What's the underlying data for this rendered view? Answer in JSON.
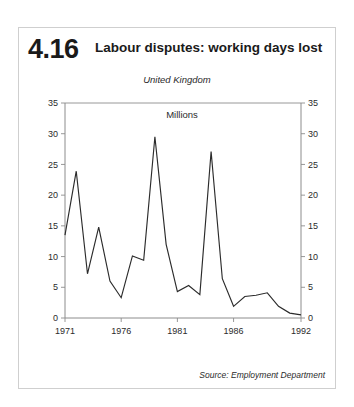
{
  "figure": {
    "number": "4.16",
    "title": "Labour disputes: working days lost",
    "region": "United Kingdom",
    "units": "Millions",
    "source": "Source: Employment Department",
    "border_color": "#cfcfcf",
    "line_color": "#2b2b2b",
    "axis_color": "#8c8c8c"
  },
  "chart_data": {
    "type": "line",
    "title": "Labour disputes: working days lost",
    "subtitle": "United Kingdom",
    "xlabel": "",
    "ylabel": "Millions",
    "units": "Millions",
    "source": "Source: Employment Department",
    "grid": false,
    "legend": "none",
    "xlim": [
      1971,
      1992
    ],
    "ylim": [
      0,
      35
    ],
    "ytick_labels": [
      "0",
      "5",
      "10",
      "15",
      "20",
      "25",
      "30",
      "35"
    ],
    "yticks": [
      0,
      5,
      10,
      15,
      20,
      25,
      30,
      35
    ],
    "xtick_labels": [
      "1971",
      "1976",
      "1981",
      "1986",
      "1992"
    ],
    "xticks": [
      1971,
      1976,
      1981,
      1986,
      1992
    ],
    "dual_y_axis": true,
    "x": [
      1971,
      1972,
      1973,
      1974,
      1975,
      1976,
      1977,
      1978,
      1979,
      1980,
      1981,
      1982,
      1983,
      1984,
      1985,
      1986,
      1987,
      1988,
      1989,
      1990,
      1991,
      1992
    ],
    "series": [
      {
        "name": "Working days lost",
        "values": [
          13.5,
          23.9,
          7.2,
          14.8,
          6.0,
          3.3,
          10.1,
          9.4,
          29.5,
          12.0,
          4.3,
          5.3,
          3.8,
          27.1,
          6.4,
          1.9,
          3.5,
          3.7,
          4.1,
          1.9,
          0.8,
          0.5
        ]
      }
    ]
  }
}
